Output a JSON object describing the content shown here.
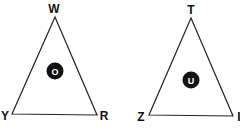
{
  "triangles": [
    {
      "name": "left",
      "vertices": {
        "top": "W",
        "bottom_left": "Y",
        "bottom_right": "R"
      },
      "center": "O"
    },
    {
      "name": "right",
      "vertices": {
        "top": "T",
        "bottom_left": "Z",
        "bottom_right": "I"
      },
      "center": "U"
    }
  ],
  "colors": {
    "stroke": "#222222",
    "circle": "#111111",
    "background": "#ffffff"
  }
}
